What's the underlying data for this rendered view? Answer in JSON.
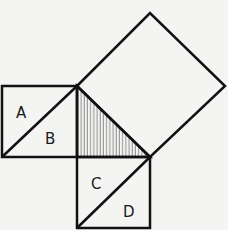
{
  "diagram": {
    "labels": {
      "a": "A",
      "b": "B",
      "c": "C",
      "d": "D"
    },
    "colors": {
      "stroke": "#111111",
      "background": "#f4f4f2",
      "hatch": "#555555"
    }
  }
}
